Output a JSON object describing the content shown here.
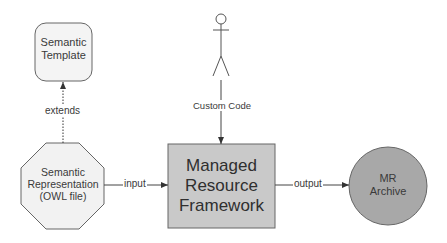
{
  "diagram": {
    "nodes": {
      "semantic_template": {
        "line1": "Semantic",
        "line2": "Template",
        "shape": "rounded-rectangle",
        "fill": "#f2f2f2"
      },
      "semantic_representation": {
        "line1": "Semantic",
        "line2": "Representation",
        "line3": "(OWL file)",
        "shape": "octagon",
        "fill": "#f2f2f2"
      },
      "managed_resource_framework": {
        "line1": "Managed",
        "line2": "Resource",
        "line3": "Framework",
        "shape": "rectangle",
        "fill": "#c8c8c8"
      },
      "mr_archive": {
        "line1": "MR",
        "line2": "Archive",
        "shape": "circle",
        "fill": "#a9a9a9"
      },
      "actor": {
        "shape": "stick-figure"
      }
    },
    "edges": {
      "extends": {
        "label": "extends",
        "from": "Semantic Representation",
        "to": "Semantic Template",
        "style": "dotted"
      },
      "custom_code": {
        "label": "Custom Code",
        "from": "actor",
        "to": "Managed Resource Framework",
        "style": "solid"
      },
      "input": {
        "label": "input",
        "from": "Semantic Representation",
        "to": "Managed Resource Framework",
        "style": "solid"
      },
      "output": {
        "label": "output",
        "from": "Managed Resource Framework",
        "to": "MR Archive",
        "style": "solid"
      }
    },
    "colors": {
      "stroke": "#555555",
      "text": "#3a3a3a"
    }
  }
}
